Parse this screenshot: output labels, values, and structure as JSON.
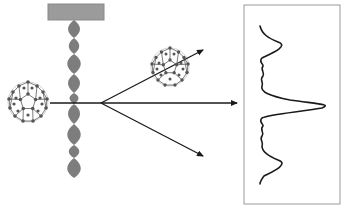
{
  "diagram": {
    "colors": {
      "background": "#ffffff",
      "grating_bar": "#9b9b9b",
      "grating_bar_edge": "#8a8a8a",
      "grating_slits": "#7d7d7d",
      "molecule_atom": "#555555",
      "molecule_bond": "#444444",
      "arrow": "#1a1a1a",
      "detector_border": "#9a9a9a",
      "pattern_curve": "#1a1a1a"
    },
    "elements": {
      "source_molecule": "fullerene-molecule",
      "grating": "diffraction-grating",
      "beams": [
        "upper-diffracted-beam",
        "central-beam",
        "lower-diffracted-beam"
      ],
      "scattered_molecule": "fullerene-molecule",
      "detector": "interference-pattern-panel"
    }
  }
}
